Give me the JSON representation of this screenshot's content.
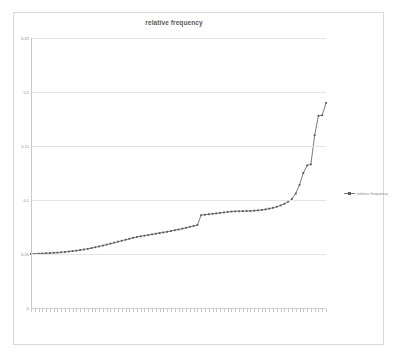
{
  "chart": {
    "title": "relative frequency",
    "legend": {
      "label": "relative frequency",
      "position": "right"
    }
  },
  "chart_data": {
    "type": "line",
    "title": "relative frequency",
    "xlabel": "",
    "ylabel": "",
    "ylim": [
      0,
      0.25
    ],
    "yticks": [
      0,
      0.05,
      0.1,
      0.15,
      0.2,
      0.25
    ],
    "ytick_labels": [
      "0",
      "0.05",
      "0.1",
      "0.15",
      "0.2",
      "0.25"
    ],
    "grid": true,
    "legend_position": "right",
    "marker": "square",
    "line_color": "#595959",
    "series": [
      {
        "name": "relative frequency",
        "values": [
          0.05,
          0.0501,
          0.0503,
          0.0505,
          0.0507,
          0.0509,
          0.0511,
          0.0513,
          0.0516,
          0.0519,
          0.0523,
          0.0527,
          0.0531,
          0.0536,
          0.0542,
          0.0548,
          0.0555,
          0.0562,
          0.057,
          0.0578,
          0.0587,
          0.0596,
          0.0605,
          0.0614,
          0.0623,
          0.0632,
          0.0641,
          0.065,
          0.0658,
          0.0664,
          0.067,
          0.0676,
          0.0682,
          0.0688,
          0.0694,
          0.07,
          0.0706,
          0.0713,
          0.072,
          0.0727,
          0.0735,
          0.0743,
          0.0752,
          0.076,
          0.0768,
          0.086,
          0.0864,
          0.0868,
          0.0872,
          0.0876,
          0.088,
          0.0885,
          0.089,
          0.0893,
          0.0895,
          0.0896,
          0.0897,
          0.0898,
          0.0899,
          0.0901,
          0.0904,
          0.0908,
          0.0913,
          0.092,
          0.0928,
          0.0938,
          0.095,
          0.0965,
          0.0985,
          0.101,
          0.106,
          0.114,
          0.125,
          0.132,
          0.133,
          0.16,
          0.178,
          0.1785,
          0.19
        ]
      }
    ],
    "categories": [
      "",
      "",
      "",
      "",
      "",
      "",
      "",
      "",
      "",
      "",
      "",
      "",
      "",
      "",
      "",
      "",
      "",
      "",
      "",
      "",
      "",
      "",
      "",
      "",
      "",
      "",
      "",
      "",
      "",
      "",
      "",
      "",
      "",
      "",
      "",
      "",
      "",
      "",
      "",
      "",
      "",
      "",
      "",
      "",
      "",
      "",
      "",
      "",
      "",
      "",
      "",
      "",
      "",
      "",
      "",
      "",
      "",
      "",
      "",
      "",
      "",
      "",
      "",
      "",
      "",
      "",
      "",
      "",
      "",
      "",
      "",
      "",
      "",
      "",
      "",
      "",
      "",
      "",
      ""
    ]
  }
}
